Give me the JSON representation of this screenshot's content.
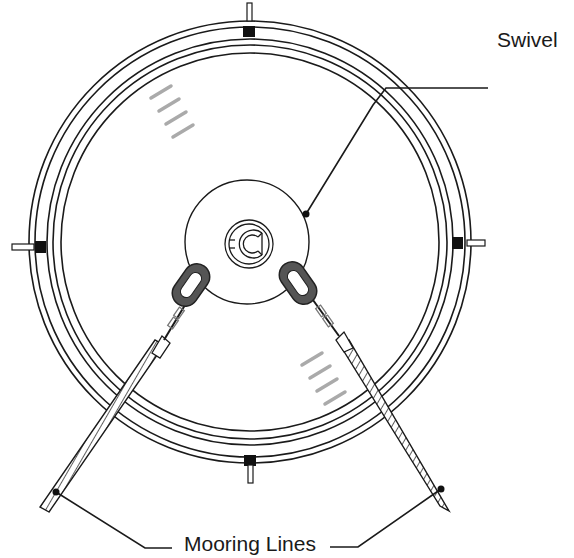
{
  "title_fragment": "g                 g",
  "labels": {
    "swivel": "Swivel",
    "mooring_lines": "Mooring Lines"
  },
  "diagram": {
    "center": [
      250,
      242
    ],
    "ring_radii": [
      221,
      215,
      203,
      197,
      189
    ],
    "swivel_plate_radius": 62,
    "colors": {
      "line": "#1a1a1a",
      "chain_link": "#555555",
      "hatch": "#999999",
      "background": "#ffffff"
    },
    "callouts": [
      {
        "label": "Swivel",
        "target": "swivel-plate-edge"
      },
      {
        "label": "Mooring Lines",
        "targets": [
          "left-mooring-line",
          "right-mooring-line"
        ]
      }
    ]
  }
}
